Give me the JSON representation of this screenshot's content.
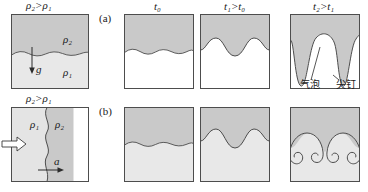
{
  "figure": {
    "row_labels": [
      {
        "name": "row-label-a",
        "text": "(a)"
      },
      {
        "name": "row-label-b",
        "text": "(b)"
      }
    ],
    "column_time_labels": [
      {
        "name": "time-label-t0",
        "text": "t₀"
      },
      {
        "name": "time-label-t1",
        "text": "t₁>t₀"
      },
      {
        "name": "time-label-t2",
        "text": "t₂>t₁"
      }
    ],
    "density_condition_top": "ρ₂>ρ₁",
    "density_condition_bottom": "ρ₂>ρ₁",
    "panel_a_setup": {
      "upper_fluid_label": "ρ₂",
      "lower_fluid_label": "ρ₁",
      "gravity_label": "g"
    },
    "panel_b_setup": {
      "left_fluid_label": "ρ₁",
      "right_fluid_label": "ρ₂",
      "acceleration_label": "a"
    },
    "annotations": [
      {
        "name": "bubble-annotation",
        "text": "气泡"
      },
      {
        "name": "spike-annotation",
        "text": "尖钉"
      }
    ],
    "colors": {
      "heavy_fluid_fill": "#c9c9c9",
      "light_fluid_fill": "#e8e8e8",
      "white_fill": "#ffffff",
      "stroke": "#4d4d4d",
      "text": "#1a1a1a"
    }
  }
}
